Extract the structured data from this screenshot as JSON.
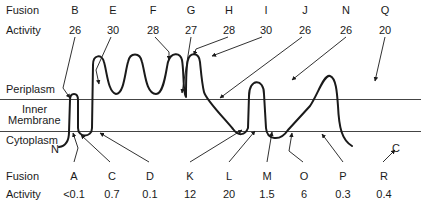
{
  "top": {
    "fusion_label": "Fusion",
    "activity_label": "Activity",
    "columns": [
      {
        "fusion": "B",
        "activity": "26"
      },
      {
        "fusion": "E",
        "activity": "30"
      },
      {
        "fusion": "F",
        "activity": "28"
      },
      {
        "fusion": "G",
        "activity": "27"
      },
      {
        "fusion": "H",
        "activity": "28"
      },
      {
        "fusion": "I",
        "activity": "30"
      },
      {
        "fusion": "J",
        "activity": "26"
      },
      {
        "fusion": "N",
        "activity": "26"
      },
      {
        "fusion": "Q",
        "activity": "20"
      }
    ]
  },
  "bottom": {
    "fusion_label": "Fusion",
    "activity_label": "Activity",
    "columns": [
      {
        "fusion": "A",
        "activity": "<0.1"
      },
      {
        "fusion": "C",
        "activity": "0.7"
      },
      {
        "fusion": "D",
        "activity": "0.1"
      },
      {
        "fusion": "K",
        "activity": "12"
      },
      {
        "fusion": "L",
        "activity": "20"
      },
      {
        "fusion": "M",
        "activity": "1.5"
      },
      {
        "fusion": "O",
        "activity": "6"
      },
      {
        "fusion": "P",
        "activity": "0.3"
      },
      {
        "fusion": "R",
        "activity": "0.4"
      }
    ]
  },
  "regions": {
    "periplasm": "Periplasm",
    "inner_membrane_line1": "Inner",
    "inner_membrane_line2": "Membrane",
    "cytoplasm": "Cytoplasm"
  },
  "termini": {
    "n_terminus": "N",
    "c_terminus": "C"
  },
  "colors": {
    "line": "#1a1a1a",
    "membrane": "#444444",
    "background": "#ffffff"
  }
}
